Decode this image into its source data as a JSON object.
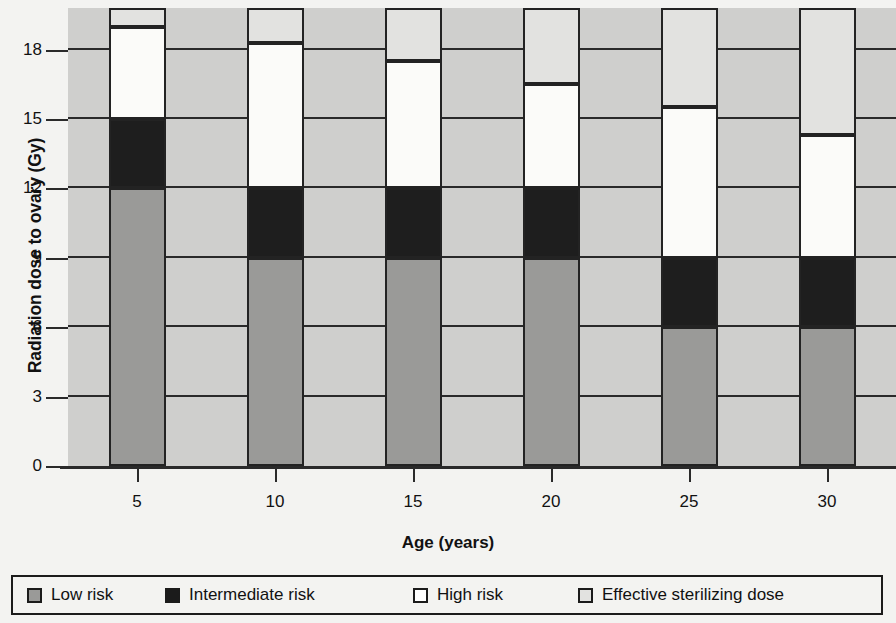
{
  "chart_data": {
    "type": "bar",
    "subtype": "stacked-bar",
    "title": "",
    "xlabel": "Age (years)",
    "ylabel": "Radiation dose to ovary (Gy)",
    "categories": [
      "5",
      "10",
      "15",
      "20",
      "25",
      "30"
    ],
    "x": [
      5,
      10,
      15,
      20,
      25,
      30
    ],
    "ylim": [
      0,
      19.8
    ],
    "yticks": [
      0,
      3,
      6,
      9,
      12,
      15,
      18
    ],
    "ytick_labels": [
      "0",
      "3",
      "6",
      "9",
      "12",
      "15",
      "18"
    ],
    "xticks": [
      5,
      10,
      15,
      20,
      25,
      30
    ],
    "xtick_labels": [
      "5",
      "10",
      "15",
      "20",
      "25",
      "30"
    ],
    "grid": "horizontal",
    "legend_position": "bottom",
    "series": [
      {
        "name": "Low risk",
        "color": "#9a9a98",
        "values": [
          12.0,
          9.0,
          9.0,
          9.0,
          6.0,
          6.0
        ],
        "tops": [
          12.0,
          9.0,
          9.0,
          9.0,
          6.0,
          6.0
        ]
      },
      {
        "name": "Intermediate risk",
        "color": "#1e1e1e",
        "values": [
          3.0,
          3.0,
          3.0,
          3.0,
          3.0,
          3.0
        ],
        "tops": [
          15.0,
          12.0,
          12.0,
          12.0,
          9.0,
          9.0
        ]
      },
      {
        "name": "High risk",
        "color": "#fbfbf9",
        "values": [
          4.0,
          6.3,
          5.5,
          4.5,
          6.5,
          5.3
        ],
        "tops": [
          19.0,
          18.3,
          17.5,
          16.5,
          15.5,
          14.3
        ]
      },
      {
        "name": "Effective sterilizing dose",
        "color": "#e2e2e0",
        "values": [
          0.8,
          1.5,
          2.3,
          3.3,
          4.3,
          5.5
        ],
        "tops": [
          19.8,
          19.8,
          19.8,
          19.8,
          19.8,
          19.8
        ]
      }
    ]
  },
  "legend": {
    "items": [
      {
        "label": "Low risk",
        "swatch": "low"
      },
      {
        "label": "Intermediate risk",
        "swatch": "int"
      },
      {
        "label": "High risk",
        "swatch": "high"
      },
      {
        "label": "Effective sterilizing dose",
        "swatch": "esd"
      }
    ]
  },
  "colors": {
    "low_risk": "#9a9a98",
    "intermediate_risk": "#1e1e1e",
    "high_risk": "#fbfbf9",
    "effective_sterilizing_dose": "#e2e2e0",
    "plot_background": "#c9c9c7",
    "axis": "#2a2a2a"
  }
}
